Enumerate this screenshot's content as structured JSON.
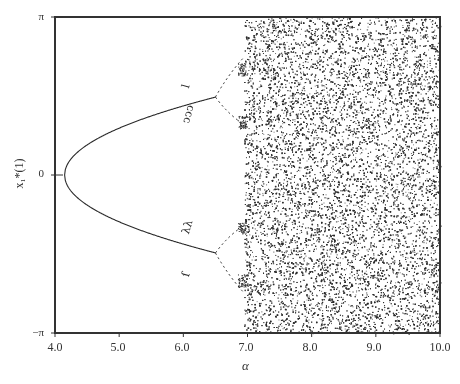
{
  "chart_data": {
    "type": "scatter",
    "title": "",
    "subtype": "bifurcation diagram",
    "xlabel": "α",
    "ylabel": "x₁*(1)",
    "xlim": [
      4.0,
      10.0
    ],
    "ylim": [
      -3.14159,
      3.14159
    ],
    "grid": false,
    "legend": null,
    "x_ticks": [
      4.0,
      5.0,
      6.0,
      7.0,
      8.0,
      9.0,
      10.0
    ],
    "x_tick_labels": [
      "4.0",
      "5.0",
      "6.0",
      "7.0",
      "8.0",
      "9.0",
      "10.0"
    ],
    "y_ticks": [
      3.14159,
      0,
      -3.14159
    ],
    "y_tick_labels": [
      "π",
      "0",
      "−π"
    ],
    "series": [
      {
        "name": "fixed-point branches (period 1)",
        "kind": "curve",
        "alpha_start": 4.15,
        "alpha_end": 6.5,
        "formula": "x = ±1.01*sqrt(alpha - 4.15)",
        "points_upper": [
          [
            4.15,
            0.0
          ],
          [
            4.5,
            0.6
          ],
          [
            5.0,
            0.93
          ],
          [
            5.5,
            1.17
          ],
          [
            6.0,
            1.37
          ],
          [
            6.5,
            1.55
          ]
        ],
        "points_lower": [
          [
            4.15,
            0.0
          ],
          [
            4.5,
            -0.6
          ],
          [
            5.0,
            -0.93
          ],
          [
            5.5,
            -1.17
          ],
          [
            6.0,
            -1.37
          ],
          [
            6.5,
            -1.55
          ]
        ]
      },
      {
        "name": "period-doubling cascade",
        "kind": "dashed-branches",
        "alpha_start": 6.5,
        "alpha_end": 6.95,
        "upper_split": [
          [
            6.5,
            1.55
          ],
          [
            6.7,
            2.0
          ],
          [
            6.95,
            2.35
          ]
        ],
        "upper_split_low": [
          [
            6.5,
            1.55
          ],
          [
            6.7,
            1.2
          ],
          [
            6.95,
            1.0
          ]
        ],
        "lower_split": [
          [
            6.5,
            -1.55
          ],
          [
            6.7,
            -1.2
          ],
          [
            6.95,
            -1.0
          ]
        ],
        "lower_split_low": [
          [
            6.5,
            -1.55
          ],
          [
            6.7,
            -2.0
          ],
          [
            6.95,
            -2.35
          ]
        ]
      },
      {
        "name": "isolated periodic windows",
        "kind": "marks",
        "marks": [
          {
            "alpha": 6.05,
            "x": 1.85,
            "glyph": "ⅼ"
          },
          {
            "alpha": 6.05,
            "x": 1.15,
            "glyph": "ↄↄↄ"
          },
          {
            "alpha": 6.05,
            "x": -1.05,
            "glyph": "λλ"
          },
          {
            "alpha": 6.05,
            "x": -1.9,
            "glyph": "ſ"
          }
        ]
      },
      {
        "name": "chaotic region",
        "kind": "dense-scatter",
        "alpha_start": 6.95,
        "alpha_end": 10.0,
        "x_range": [
          -3.14159,
          3.14159
        ],
        "approx_points": 16000
      }
    ]
  },
  "axes": {
    "y_ticks": [
      {
        "label": "π"
      },
      {
        "label": "0"
      },
      {
        "label": "−π"
      }
    ],
    "x_ticks": [
      {
        "label": "4.0"
      },
      {
        "label": "5.0"
      },
      {
        "label": "6.0"
      },
      {
        "label": "7.0"
      },
      {
        "label": "8.0"
      },
      {
        "label": "9.0"
      },
      {
        "label": "10.0"
      }
    ],
    "x_label": "α",
    "y_label": "x₁*(1)"
  },
  "colors": {
    "ink": "#2a2a2a",
    "frame": "#333333",
    "background": "#ffffff"
  }
}
